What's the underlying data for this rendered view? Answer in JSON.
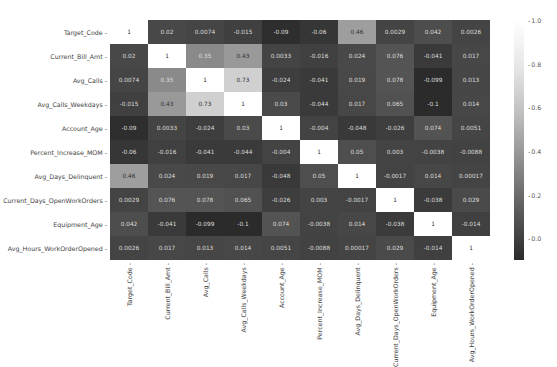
{
  "chart_data": {
    "type": "heatmap",
    "title": "",
    "xlabel": "",
    "ylabel": "",
    "labels": [
      "Target_Code",
      "Current_Bill_Amt",
      "Avg_Calls",
      "Avg_Calls_Weekdays",
      "Account_Age",
      "Percent_Increase_MOM",
      "Avg_Days_Delinquent",
      "Current_Days_OpenWorkOrders",
      "Equipment_Age",
      "Avg_Hours_WorkOrderOpened"
    ],
    "values": [
      [
        1,
        0.02,
        0.0074,
        -0.015,
        -0.09,
        -0.06,
        0.46,
        0.0029,
        0.042,
        0.0026
      ],
      [
        0.02,
        1,
        0.35,
        0.43,
        0.0033,
        -0.016,
        0.024,
        0.076,
        -0.041,
        0.017
      ],
      [
        0.0074,
        0.35,
        1,
        0.73,
        -0.024,
        -0.041,
        0.019,
        0.078,
        -0.099,
        0.013
      ],
      [
        -0.015,
        0.43,
        0.73,
        1,
        0.03,
        -0.044,
        0.017,
        0.065,
        -0.1,
        0.014
      ],
      [
        -0.09,
        0.0033,
        -0.024,
        0.03,
        1,
        -0.004,
        -0.048,
        -0.026,
        0.074,
        0.0051
      ],
      [
        -0.06,
        -0.016,
        -0.041,
        -0.044,
        -0.004,
        1,
        0.05,
        0.003,
        -0.0038,
        -0.0088
      ],
      [
        0.46,
        0.024,
        0.019,
        0.017,
        -0.048,
        0.05,
        1,
        -0.0017,
        0.014,
        0.00017
      ],
      [
        0.0029,
        0.076,
        0.078,
        0.065,
        -0.026,
        0.003,
        -0.0017,
        1,
        -0.038,
        0.029
      ],
      [
        0.042,
        -0.041,
        -0.099,
        -0.1,
        0.074,
        -0.0038,
        0.014,
        -0.038,
        1,
        -0.014
      ],
      [
        0.0026,
        0.017,
        0.013,
        0.014,
        0.0051,
        -0.0088,
        0.00017,
        0.029,
        -0.014,
        1
      ]
    ],
    "colorbar": {
      "min": -0.1,
      "max": 1.0,
      "ticks": [
        "1.0",
        "0.8",
        "0.6",
        "0.4",
        "0.2",
        "0.0"
      ],
      "colormap": "gray"
    },
    "colors": {
      "low": "#2b2b2b",
      "high": "#ffffff",
      "text_dark": "#333333",
      "text_light": "#dddddd"
    }
  }
}
